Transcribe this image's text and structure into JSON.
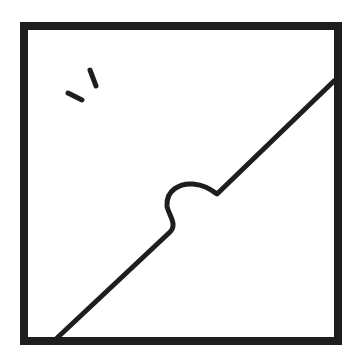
{
  "image": {
    "description": "Line drawing: square frame divided by a diagonal line with a rounded bump near the center; two short tick marks in the upper-left area",
    "colors": {
      "background": "#ffffff",
      "stroke": "#1e1e1e"
    }
  }
}
